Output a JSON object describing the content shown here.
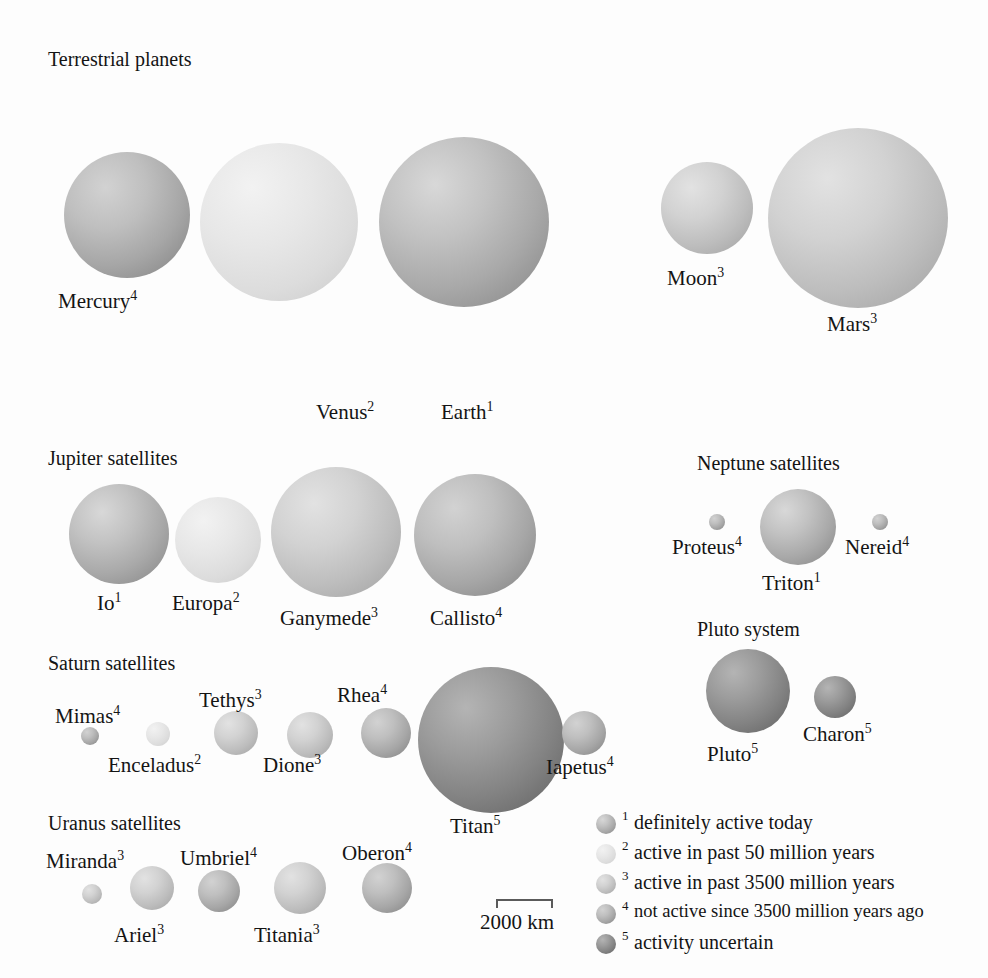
{
  "figure": {
    "kind": "scale-comparison-diagram",
    "scale_bar": {
      "label": "2000 km",
      "km": 2000,
      "pixel_length": 57
    }
  },
  "legend": {
    "classes": [
      {
        "rank": "1",
        "text": "definitely active today",
        "shade": "#b0b0b0"
      },
      {
        "rank": "2",
        "text": "active in past 50 million years",
        "shade": "#e4e4e4"
      },
      {
        "rank": "3",
        "text": "active in past 3500 million years",
        "shade": "#c9c9c9"
      },
      {
        "rank": "4",
        "text": "not active since 3500 million years ago",
        "shade": "#b6b6b6"
      },
      {
        "rank": "5",
        "text": "activity uncertain",
        "shade": "#8a8a8a"
      }
    ]
  },
  "groups": [
    {
      "id": "terrestrial",
      "title": "Terrestrial planets"
    },
    {
      "id": "jupiter",
      "title": "Jupiter satellites"
    },
    {
      "id": "saturn",
      "title": "Saturn satellites"
    },
    {
      "id": "uranus",
      "title": "Uranus satellites"
    },
    {
      "id": "neptune",
      "title": "Neptune satellites"
    },
    {
      "id": "pluto",
      "title": "Pluto system"
    }
  ],
  "bodies": [
    {
      "name": "Mercury",
      "rank": "4",
      "group": "terrestrial",
      "cx": 127,
      "cy": 215,
      "r": 63
    },
    {
      "name": "Venus",
      "rank": "2",
      "group": "terrestrial",
      "cx": 279,
      "cy": 222,
      "r": 79
    },
    {
      "name": "Earth",
      "rank": "1",
      "group": "terrestrial",
      "cx": 464,
      "cy": 222,
      "r": 85
    },
    {
      "name": "Moon",
      "rank": "3",
      "group": "terrestrial",
      "cx": 707,
      "cy": 208,
      "r": 46
    },
    {
      "name": "Mars",
      "rank": "3",
      "group": "terrestrial",
      "cx": 858,
      "cy": 218,
      "r": 90
    },
    {
      "name": "Io",
      "rank": "1",
      "group": "jupiter",
      "cx": 119,
      "cy": 534,
      "r": 50
    },
    {
      "name": "Europa",
      "rank": "2",
      "group": "jupiter",
      "cx": 218,
      "cy": 540,
      "r": 43
    },
    {
      "name": "Ganymede",
      "rank": "3",
      "group": "jupiter",
      "cx": 336,
      "cy": 532,
      "r": 65
    },
    {
      "name": "Callisto",
      "rank": "4",
      "group": "jupiter",
      "cx": 475,
      "cy": 535,
      "r": 61
    },
    {
      "name": "Mimas",
      "rank": "4",
      "group": "saturn",
      "cx": 90,
      "cy": 736,
      "r": 9
    },
    {
      "name": "Enceladus",
      "rank": "2",
      "group": "saturn",
      "cx": 158,
      "cy": 734,
      "r": 12
    },
    {
      "name": "Tethys",
      "rank": "3",
      "group": "saturn",
      "cx": 236,
      "cy": 733,
      "r": 22
    },
    {
      "name": "Dione",
      "rank": "3",
      "group": "saturn",
      "cx": 310,
      "cy": 735,
      "r": 23
    },
    {
      "name": "Rhea",
      "rank": "4",
      "group": "saturn",
      "cx": 386,
      "cy": 733,
      "r": 25
    },
    {
      "name": "Titan",
      "rank": "5",
      "group": "saturn",
      "cx": 491,
      "cy": 740,
      "r": 73
    },
    {
      "name": "Iapetus",
      "rank": "4",
      "group": "saturn",
      "cx": 584,
      "cy": 733,
      "r": 22
    },
    {
      "name": "Miranda",
      "rank": "3",
      "group": "uranus",
      "cx": 92,
      "cy": 894,
      "r": 10
    },
    {
      "name": "Ariel",
      "rank": "3",
      "group": "uranus",
      "cx": 152,
      "cy": 888,
      "r": 22
    },
    {
      "name": "Umbriel",
      "rank": "4",
      "group": "uranus",
      "cx": 219,
      "cy": 891,
      "r": 21
    },
    {
      "name": "Titania",
      "rank": "3",
      "group": "uranus",
      "cx": 300,
      "cy": 888,
      "r": 26
    },
    {
      "name": "Oberon",
      "rank": "4",
      "group": "uranus",
      "cx": 387,
      "cy": 888,
      "r": 25
    },
    {
      "name": "Proteus",
      "rank": "4",
      "group": "neptune",
      "cx": 717,
      "cy": 522,
      "r": 8
    },
    {
      "name": "Triton",
      "rank": "1",
      "group": "neptune",
      "cx": 798,
      "cy": 527,
      "r": 38
    },
    {
      "name": "Nereid",
      "rank": "4",
      "group": "neptune",
      "cx": 880,
      "cy": 522,
      "r": 8
    },
    {
      "name": "Pluto",
      "rank": "5",
      "group": "pluto",
      "cx": 748,
      "cy": 691,
      "r": 42
    },
    {
      "name": "Charon",
      "rank": "5",
      "group": "pluto",
      "cx": 835,
      "cy": 697,
      "r": 21
    }
  ],
  "group_titles_pos": [
    {
      "id": "terrestrial",
      "x": 48,
      "y": 48
    },
    {
      "id": "jupiter",
      "x": 48,
      "y": 447
    },
    {
      "id": "saturn",
      "x": 48,
      "y": 652
    },
    {
      "id": "uranus",
      "x": 48,
      "y": 812
    },
    {
      "id": "neptune",
      "x": 697,
      "y": 452
    },
    {
      "id": "pluto",
      "x": 697,
      "y": 618
    }
  ],
  "body_labels_pos": [
    {
      "name": "Mercury",
      "x": 58,
      "y": 288
    },
    {
      "name": "Venus",
      "x": 316,
      "y": 399
    },
    {
      "name": "Earth",
      "x": 441,
      "y": 399
    },
    {
      "name": "Moon",
      "x": 667,
      "y": 265
    },
    {
      "name": "Mars",
      "x": 827,
      "y": 311
    },
    {
      "name": "Io",
      "x": 97,
      "y": 590
    },
    {
      "name": "Europa",
      "x": 172,
      "y": 590
    },
    {
      "name": "Ganymede",
      "x": 280,
      "y": 605
    },
    {
      "name": "Callisto",
      "x": 430,
      "y": 605
    },
    {
      "name": "Mimas",
      "x": 55,
      "y": 703
    },
    {
      "name": "Enceladus",
      "x": 108,
      "y": 752
    },
    {
      "name": "Tethys",
      "x": 199,
      "y": 687
    },
    {
      "name": "Dione",
      "x": 263,
      "y": 752
    },
    {
      "name": "Rhea",
      "x": 337,
      "y": 682
    },
    {
      "name": "Titan",
      "x": 450,
      "y": 813
    },
    {
      "name": "Iapetus",
      "x": 546,
      "y": 754
    },
    {
      "name": "Miranda",
      "x": 46,
      "y": 848
    },
    {
      "name": "Ariel",
      "x": 114,
      "y": 922
    },
    {
      "name": "Umbriel",
      "x": 180,
      "y": 845
    },
    {
      "name": "Titania",
      "x": 254,
      "y": 922
    },
    {
      "name": "Oberon",
      "x": 342,
      "y": 840
    },
    {
      "name": "Proteus",
      "x": 672,
      "y": 534
    },
    {
      "name": "Triton",
      "x": 762,
      "y": 570
    },
    {
      "name": "Nereid",
      "x": 845,
      "y": 534
    },
    {
      "name": "Pluto",
      "x": 707,
      "y": 741
    },
    {
      "name": "Charon",
      "x": 803,
      "y": 721
    }
  ],
  "scale_bar_pos": {
    "x": 496,
    "y": 899
  }
}
